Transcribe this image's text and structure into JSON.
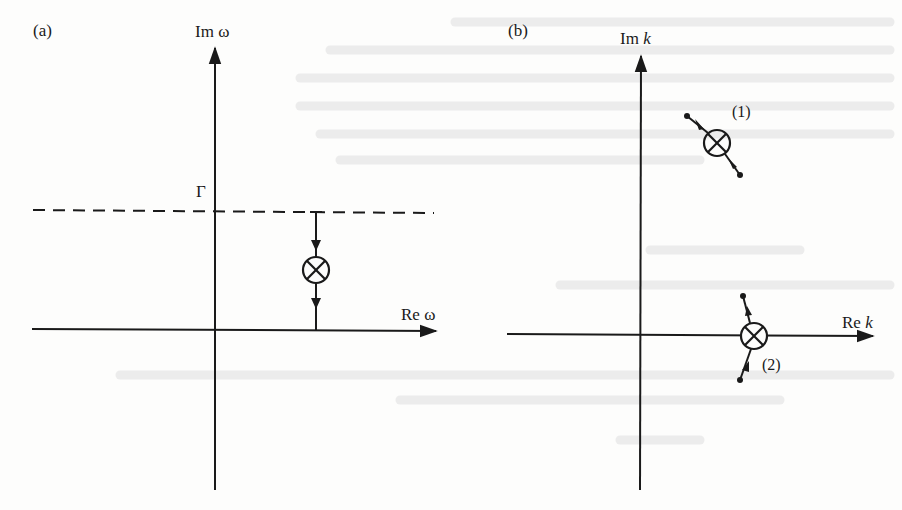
{
  "figure": {
    "panels": [
      {
        "id": "a",
        "panel_label": "(a)",
        "vertical_axis_label": "Im ω",
        "horizontal_axis_label": "Re ω",
        "contour_label": "Γ",
        "contour_style": "dashed",
        "markers": [
          {
            "symbol": "⊗",
            "description": "pole",
            "motion": "downward along vertical line from contour to real axis"
          }
        ]
      },
      {
        "id": "b",
        "panel_label": "(b)",
        "vertical_axis_label": "Im k",
        "vertical_axis_label_prefix": "Im ",
        "vertical_axis_label_var": "k",
        "horizontal_axis_label": "Re k",
        "horizontal_axis_label_prefix": "Re ",
        "horizontal_axis_label_var": "k",
        "markers": [
          {
            "symbol": "⊗",
            "tag": "(1)",
            "description": "pole in upper half plane, trajectory moving down-right"
          },
          {
            "symbol": "⊗",
            "tag": "(2)",
            "description": "pole on real axis, trajectories approaching from above and below"
          }
        ]
      }
    ]
  },
  "colors": {
    "ink": "#1a1a1a",
    "paper": "#fdfdfc",
    "bleed_through": "#ececec"
  }
}
